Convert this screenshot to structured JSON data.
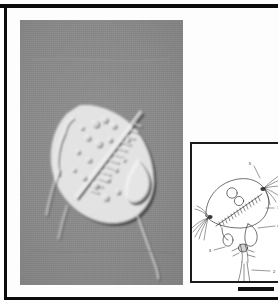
{
  "figure": {
    "kind": "scientific-plate",
    "caption_text": "",
    "frame_color": "#0c0c0c",
    "page_color": "#ffffff"
  },
  "micrograph": {
    "name": "DIC light micrograph",
    "technique": "differential interference contrast",
    "background_color": "#8a8a8a",
    "subject": "microscopic planktonic organism in lateral view",
    "alt_text": "Relief-shaded grayscale micrograph of a rounded-oval organism with internal granules, a diagonal serrated band and a trailing posterior appendage"
  },
  "inset": {
    "name": "interpretive line drawing",
    "border_color": "#1a1a1a",
    "background_color": "#ffffff",
    "alt_text": "Ink line drawing of the same organism showing numbered anatomical parts",
    "labels": [
      {
        "id": "1",
        "text": "1"
      },
      {
        "id": "2",
        "text": "2"
      },
      {
        "id": "3",
        "text": "3"
      },
      {
        "id": "4",
        "text": "4"
      },
      {
        "id": "5",
        "text": "5"
      }
    ]
  },
  "scale_bar": {
    "name": "scale bar",
    "text": "",
    "color": "#111111"
  }
}
